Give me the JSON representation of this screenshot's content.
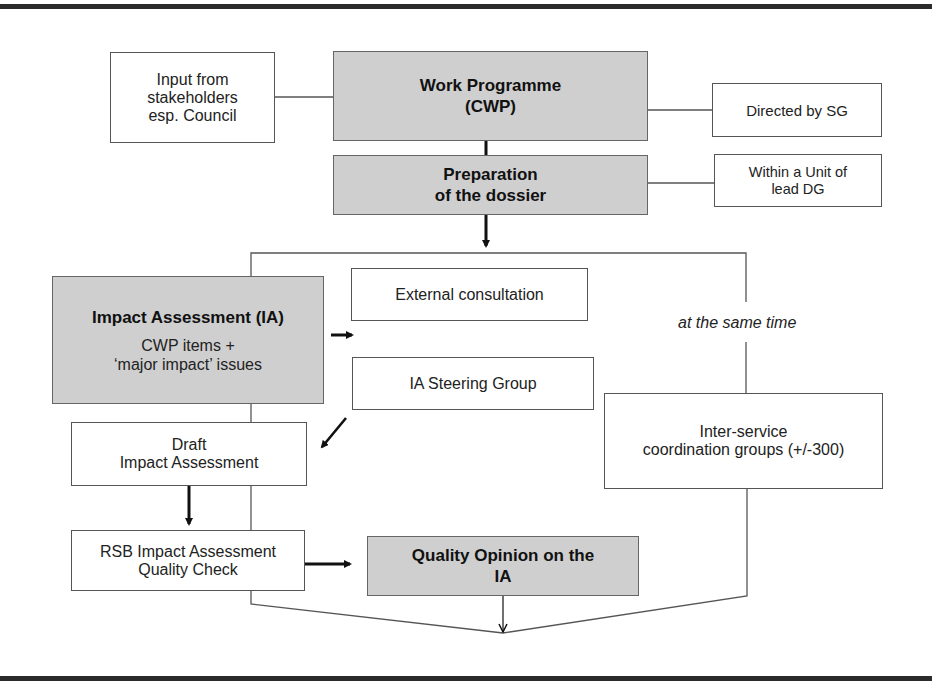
{
  "diagram": {
    "nodes": {
      "stakeholders": {
        "lines": [
          "Input from",
          "stakeholders",
          "esp. Council"
        ],
        "style": "plain"
      },
      "work_programme": {
        "lines": [
          "Work Programme",
          "(CWP)"
        ],
        "style": "gray-bold"
      },
      "directed_by_sg": {
        "lines": [
          "Directed by SG"
        ],
        "style": "plain"
      },
      "preparation": {
        "lines": [
          "Preparation",
          "of the dossier"
        ],
        "style": "gray-bold"
      },
      "within_unit": {
        "lines": [
          "Within a Unit of",
          "lead DG"
        ],
        "style": "plain"
      },
      "impact_assessment": {
        "title": "Impact Assessment (IA)",
        "sub_lines": [
          "CWP items +",
          "‘major impact’ issues"
        ],
        "style": "gray-bold"
      },
      "external_consultation": {
        "lines": [
          "External consultation"
        ],
        "style": "plain"
      },
      "ia_steering_group": {
        "lines": [
          "IA Steering Group"
        ],
        "style": "plain"
      },
      "inter_service": {
        "lines": [
          "Inter-service",
          "coordination groups (+/-300)"
        ],
        "style": "plain"
      },
      "draft_ia": {
        "lines": [
          "Draft",
          "Impact Assessment"
        ],
        "style": "plain"
      },
      "rsb_check": {
        "lines": [
          "RSB Impact Assessment",
          "Quality Check"
        ],
        "style": "plain"
      },
      "quality_opinion": {
        "lines": [
          "Quality Opinion on the",
          "IA"
        ],
        "style": "gray-bold"
      }
    },
    "annotations": {
      "parallel": "at the same time"
    },
    "edges": [
      {
        "from": "stakeholders",
        "to": "work_programme",
        "type": "line"
      },
      {
        "from": "work_programme",
        "to": "directed_by_sg",
        "type": "line"
      },
      {
        "from": "work_programme",
        "to": "preparation",
        "type": "thick-line"
      },
      {
        "from": "preparation",
        "to": "within_unit",
        "type": "line"
      },
      {
        "from": "preparation",
        "to": "branch",
        "type": "thick-arrow"
      },
      {
        "from": "branch",
        "to": "impact_assessment",
        "type": "line"
      },
      {
        "from": "branch",
        "to": "inter_service",
        "type": "line",
        "label": "at the same time"
      },
      {
        "from": "impact_assessment",
        "to": "external_consultation",
        "type": "thick-arrow"
      },
      {
        "from": "ia_steering_group",
        "to": "draft_ia",
        "type": "thick-arrow"
      },
      {
        "from": "impact_assessment",
        "to": "draft_ia",
        "type": "line"
      },
      {
        "from": "draft_ia",
        "to": "rsb_check",
        "type": "thick-arrow"
      },
      {
        "from": "rsb_check",
        "to": "quality_opinion",
        "type": "thick-arrow"
      },
      {
        "from": "rsb_check",
        "to": "merge",
        "type": "line"
      },
      {
        "from": "inter_service",
        "to": "merge",
        "type": "line"
      },
      {
        "from": "quality_opinion",
        "to": "merge",
        "type": "arrow"
      }
    ],
    "colors": {
      "gray_fill": "#cfcfcf",
      "border": "#555555",
      "frame": "#2b2b2b",
      "text": "#1a1a1a"
    }
  }
}
